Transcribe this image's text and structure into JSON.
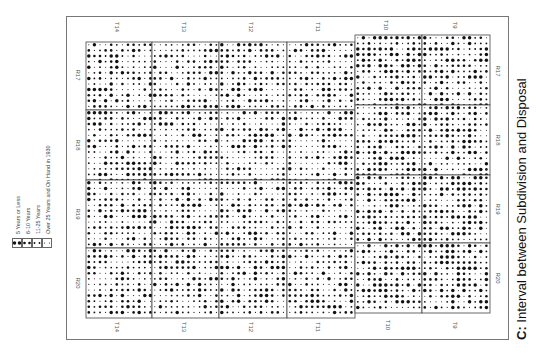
{
  "figure": {
    "caption_prefix": "C:",
    "caption_text": " Interval between Subdivision and Disposal"
  },
  "legend": {
    "items": [
      {
        "label": "5 Years or Less",
        "dot": "large"
      },
      {
        "label": "6-10 Years",
        "dot": "medium"
      },
      {
        "label": "11-25 Years",
        "dot": "small"
      },
      {
        "label": "Over 25 Years and On Hand in 1930",
        "dot": "tiny"
      }
    ]
  },
  "map": {
    "township_labels_top": [
      "T14",
      "T13",
      "T12",
      "T11",
      "T10",
      "T9"
    ],
    "township_labels_bottom": [
      "T14",
      "T13",
      "T12",
      "T11",
      "T10",
      "T9"
    ],
    "range_labels_left": [
      "R17",
      "R18",
      "R19",
      "R20"
    ],
    "range_labels_right": [
      "R17",
      "R18",
      "R19",
      "R20"
    ],
    "columns_x": [
      86,
      152,
      219,
      287,
      355,
      422,
      490
    ],
    "left_rows_y": [
      42,
      110,
      180,
      248,
      318
    ],
    "right_rows_y": [
      35,
      105,
      175,
      243,
      313
    ],
    "dot_spacing": 5.6,
    "dot_colors": {
      "ink": "#111111"
    }
  }
}
